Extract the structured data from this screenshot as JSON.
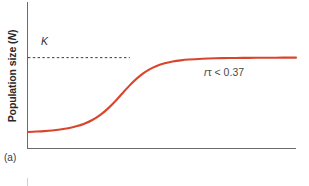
{
  "figure": {
    "panel_letter": "(a)",
    "background_color": "#ffffff",
    "axis_color": "#6b6b6b",
    "curve_color": "#d9452c",
    "dash_color": "#3a3a3a"
  },
  "axes": {
    "ylabel_text": "Population size (",
    "ylabel_italic": "N",
    "ylabel_close": ")",
    "ylabel_full": "Population size (N)",
    "xlabel": ""
  },
  "labels": {
    "carrying_capacity": "K",
    "annotation_prefix": "r",
    "annotation_symbol": "τ",
    "annotation_suffix": " < 0.37",
    "annotation_full": "rτ < 0.37"
  },
  "chart_data": {
    "type": "line",
    "title": "",
    "subtitle": "",
    "xlabel": "",
    "ylabel": "Population size (N)",
    "xlim": [
      0,
      100
    ],
    "ylim": [
      0,
      1.12
    ],
    "grid": false,
    "legend_position": "none",
    "series": [
      {
        "name": "Logistic growth (rτ < 0.37)",
        "color": "#d9452c",
        "x": [
          0,
          3,
          6,
          9,
          12,
          15,
          18,
          21,
          24,
          27,
          30,
          33,
          36,
          39,
          42,
          45,
          48,
          51,
          54,
          57,
          60,
          65,
          70,
          75,
          80,
          85,
          90,
          95,
          100
        ],
        "y": [
          0.075,
          0.08,
          0.086,
          0.094,
          0.106,
          0.122,
          0.145,
          0.178,
          0.224,
          0.288,
          0.372,
          0.473,
          0.585,
          0.691,
          0.78,
          0.848,
          0.896,
          0.929,
          0.951,
          0.966,
          0.976,
          0.986,
          0.992,
          0.995,
          0.997,
          0.998,
          0.999,
          1.0,
          1.0
        ]
      }
    ],
    "reference_lines": [
      {
        "name": "carrying-capacity",
        "label": "K",
        "orientation": "horizontal",
        "value": 1.0,
        "style": "dashed",
        "color": "#3a3a3a",
        "x_start": 0,
        "x_end": 38
      }
    ],
    "annotations": [
      {
        "text": "rτ < 0.37",
        "x": 66,
        "y": 0.62
      },
      {
        "text": "K",
        "x": 5,
        "y": 1.08
      }
    ]
  }
}
